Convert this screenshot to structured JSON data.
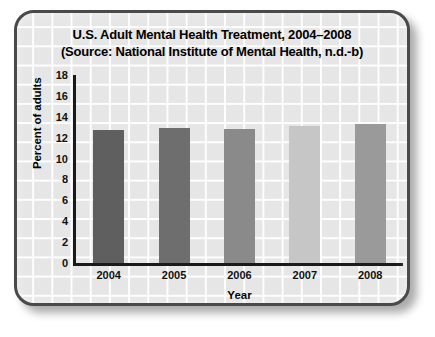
{
  "chart_data": {
    "type": "bar",
    "title": "U.S. Adult Mental Health Treatment, 2004–2008",
    "subtitle": "(Source: National Institute of Mental Health, n.d.-b)",
    "title_lines": [
      "U.S. Adult Mental Health Treatment, 2004–2008",
      "(Source: National Institute of Mental Health, n.d.-b)"
    ],
    "categories": [
      "2004",
      "2005",
      "2006",
      "2007",
      "2008"
    ],
    "values": [
      12.7,
      12.9,
      12.8,
      13.1,
      13.3
    ],
    "series": [
      {
        "name": "Percent of adults receiving mental health treatment",
        "values": [
          12.7,
          12.9,
          12.8,
          13.1,
          13.3
        ]
      }
    ],
    "bar_colors": [
      "#5f5f5f",
      "#6e6e6e",
      "#8a8a8a",
      "#c6c6c6",
      "#9a9a9a"
    ],
    "xlabel": "Year",
    "ylabel": "Percent of adults",
    "ylim": [
      0,
      18
    ],
    "yticks": [
      18,
      16,
      14,
      12,
      10,
      8,
      6,
      4,
      2,
      0
    ],
    "ytick_labels": [
      "18",
      "16",
      "14",
      "12",
      "10",
      "8",
      "6",
      "4",
      "2",
      "0"
    ],
    "grid": true,
    "legend": false,
    "legend_position": "none"
  },
  "figure": {
    "background_color": "#ffffff",
    "panel_color": "#e6e6e6",
    "border_color": "#4a4a4a",
    "axis_color": "#1a1a1a",
    "grid_color": "#ffffff"
  }
}
